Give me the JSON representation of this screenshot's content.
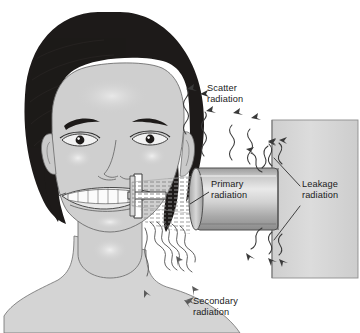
{
  "figure": {
    "type": "diagram"
  },
  "labels": {
    "scatter": "Scatter\nradiation",
    "primary": "Primary\nradiation",
    "leakage": "Leakage\nradiation",
    "secondary": "Secondary\nradiation"
  },
  "colors": {
    "background": "#ffffff",
    "outline": "#3a3a3a",
    "hair": "#1d1a19",
    "skin": "#cfcfcf",
    "skin_shadow": "#bdbdbd",
    "skin_highlight": "#ececec",
    "wall": "#d6d6d6",
    "wall_edge": "#8e8e8e",
    "tube_light": "#e6e6e6",
    "tube_mid": "#b4b4b4",
    "tube_dark": "#8d8d8d",
    "beam": "#9a9a9a",
    "text": "#1a1a1a"
  },
  "elements": {
    "patient": "patient-head-and-shoulders",
    "tubehead": "x-ray-tubehead-cone",
    "housing": "x-ray-machine-wall-housing",
    "film": "intraoral-film-holder",
    "primary_beam": "hatched-primary-beam-cone",
    "scatter_rays": "wavy-arrows-from-head",
    "leakage_rays": "wavy-arrows-at-tubehead-housing-junction",
    "secondary_rays": "wavy-arrows-from-jaw-downward"
  }
}
